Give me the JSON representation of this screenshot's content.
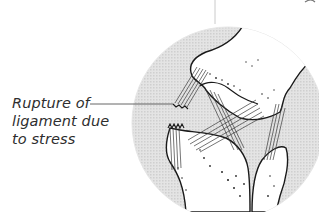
{
  "diagram": {
    "callouts": [
      {
        "id": "ligament-rupture",
        "lines": [
          "Rupture of",
          "ligament due",
          "to stress"
        ]
      }
    ],
    "colors": {
      "background": "#ffffff",
      "circle_fill": "#d9d9d9",
      "outline": "#1a1a1a",
      "leader_line": "#555555",
      "label_text": "#2e2e2e"
    }
  }
}
